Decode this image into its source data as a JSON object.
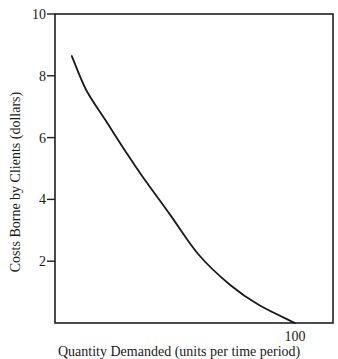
{
  "chart_data": {
    "type": "line",
    "title": "",
    "xlabel": "Quantity Demanded (units per time period)",
    "ylabel": "Costs Borne by Clients (dollars)",
    "xlim": [
      0,
      115
    ],
    "ylim": [
      0,
      10
    ],
    "x_ticks": [
      100
    ],
    "x_tick_labels": [
      "100"
    ],
    "y_ticks": [
      2,
      4,
      6,
      8,
      10
    ],
    "y_tick_labels": [
      "2",
      "4",
      "6",
      "8",
      "10"
    ],
    "grid": false,
    "legend": null,
    "series": [
      {
        "name": "Demand curve",
        "x": [
          7,
          13,
          21,
          29,
          36,
          48,
          60,
          73,
          85,
          100
        ],
        "y": [
          8.64,
          7.54,
          6.57,
          5.6,
          4.79,
          3.5,
          2.2,
          1.23,
          0.58,
          0
        ],
        "color": "#1a1a1a"
      }
    ]
  },
  "plot": {
    "left": 55,
    "top": 14,
    "right": 333,
    "bottom": 323,
    "x_px_per_unit": 2.4,
    "y_px_per_unit": 30.9
  }
}
